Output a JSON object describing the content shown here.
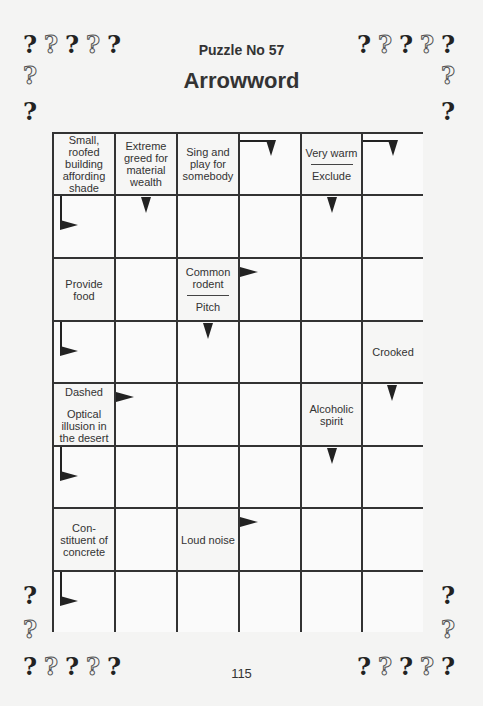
{
  "header": {
    "subtitle": "Puzzle No 57",
    "title": "Arrowword"
  },
  "footer": {
    "page_number": "115"
  },
  "decoration": {
    "question_mark": "?",
    "pattern": [
      "solid",
      "outline",
      "solid",
      "outline",
      "solid"
    ]
  },
  "grid": {
    "columns": 6,
    "rows": 8,
    "clues": [
      {
        "row": 0,
        "col": 0,
        "lines": [
          "Small, roofed building affording shade"
        ]
      },
      {
        "row": 0,
        "col": 1,
        "lines": [
          "Extreme greed for material wealth"
        ]
      },
      {
        "row": 0,
        "col": 2,
        "lines": [
          "Sing and play for somebody"
        ]
      },
      {
        "row": 0,
        "col": 4,
        "lines": [
          "Very warm",
          "Exclude"
        ]
      },
      {
        "row": 2,
        "col": 0,
        "lines": [
          "Provide food"
        ]
      },
      {
        "row": 2,
        "col": 2,
        "lines": [
          "Common rodent",
          "Pitch"
        ]
      },
      {
        "row": 3,
        "col": 5,
        "lines": [
          "Crooked"
        ]
      },
      {
        "row": 4,
        "col": 0,
        "lines": [
          "Dashed",
          "Optical illusion in the desert"
        ]
      },
      {
        "row": 4,
        "col": 4,
        "lines": [
          "Alcoholic spirit"
        ]
      },
      {
        "row": 6,
        "col": 0,
        "lines": [
          "Con-stituent of concrete"
        ]
      },
      {
        "row": 6,
        "col": 2,
        "lines": [
          "Loud noise"
        ]
      }
    ],
    "arrows": [
      {
        "row": 0,
        "col": 3,
        "type": "bent-down"
      },
      {
        "row": 0,
        "col": 5,
        "type": "bent-down"
      },
      {
        "row": 1,
        "col": 0,
        "type": "bent-right"
      },
      {
        "row": 1,
        "col": 1,
        "type": "down"
      },
      {
        "row": 1,
        "col": 4,
        "type": "down"
      },
      {
        "row": 2,
        "col": 3,
        "type": "right"
      },
      {
        "row": 3,
        "col": 0,
        "type": "bent-right"
      },
      {
        "row": 3,
        "col": 2,
        "type": "down"
      },
      {
        "row": 4,
        "col": 1,
        "type": "right"
      },
      {
        "row": 4,
        "col": 5,
        "type": "down"
      },
      {
        "row": 5,
        "col": 0,
        "type": "bent-right"
      },
      {
        "row": 5,
        "col": 4,
        "type": "down"
      },
      {
        "row": 6,
        "col": 3,
        "type": "right"
      },
      {
        "row": 7,
        "col": 0,
        "type": "bent-right"
      }
    ]
  }
}
